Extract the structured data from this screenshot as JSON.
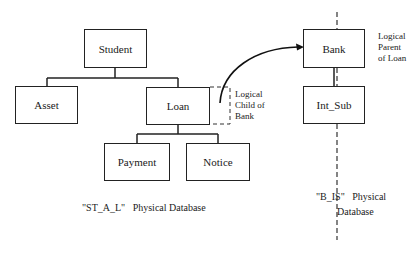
{
  "diagram": {
    "left_database": {
      "caption": "\"ST_A_L\"   Physical Database",
      "nodes": {
        "student": "Student",
        "asset": "Asset",
        "loan": "Loan",
        "payment": "Payment",
        "notice": "Notice"
      },
      "logical_child_label": [
        "Logical",
        "Child of",
        "Bank"
      ]
    },
    "right_database": {
      "caption_line1": "\"B_IS\"   Physical",
      "caption_line2": "Database",
      "nodes": {
        "bank": "Bank",
        "int_sub": "Int_Sub"
      },
      "logical_parent_label": [
        "Logical",
        "Parent",
        "of Loan"
      ]
    },
    "edges": [
      {
        "from": "Student",
        "to": "Asset",
        "type": "hierarchy"
      },
      {
        "from": "Student",
        "to": "Loan",
        "type": "hierarchy"
      },
      {
        "from": "Loan",
        "to": "Payment",
        "type": "hierarchy"
      },
      {
        "from": "Loan",
        "to": "Notice",
        "type": "hierarchy"
      },
      {
        "from": "Bank",
        "to": "Int_Sub",
        "type": "hierarchy"
      },
      {
        "from": "Loan",
        "to": "Bank",
        "type": "logical-pointer"
      }
    ]
  }
}
